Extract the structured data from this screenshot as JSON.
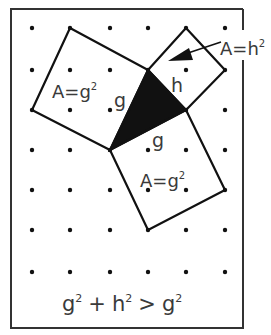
{
  "figure": {
    "border": {
      "x": 11,
      "y": 9,
      "w": 232,
      "h": 319
    },
    "dot_grid": {
      "xs": [
        32,
        70,
        110,
        148,
        186,
        225
      ],
      "ys": [
        28,
        70,
        110,
        150,
        190,
        230,
        272
      ]
    },
    "shapes": {
      "square_g_upper": [
        [
          70,
          28
        ],
        [
          148,
          70
        ],
        [
          110,
          150
        ],
        [
          32,
          110
        ]
      ],
      "square_h": [
        [
          148,
          70
        ],
        [
          186,
          28
        ],
        [
          225,
          70
        ],
        [
          186,
          110
        ]
      ],
      "square_g_lower": [
        [
          110,
          150
        ],
        [
          186,
          110
        ],
        [
          225,
          190
        ],
        [
          148,
          230
        ]
      ],
      "triangle": [
        [
          148,
          70
        ],
        [
          186,
          110
        ],
        [
          110,
          150
        ]
      ]
    },
    "colors": {
      "line": "#111111",
      "fill": "#111111",
      "text": "#3a3a3a"
    }
  },
  "labels": {
    "area_g_upper": {
      "A": "A=g",
      "exp": "2"
    },
    "area_h": {
      "A": "A=h",
      "exp": "2"
    },
    "area_g_lower": {
      "A": "A=g",
      "exp": "2"
    },
    "side_g_left": "g",
    "side_h": "h",
    "side_g_bottom": "g"
  },
  "equation": {
    "t1": "g",
    "e1": "2",
    "op1": "+",
    "t2": "h",
    "e2": "2",
    "op2": ">",
    "t3": "g",
    "e3": "2"
  }
}
